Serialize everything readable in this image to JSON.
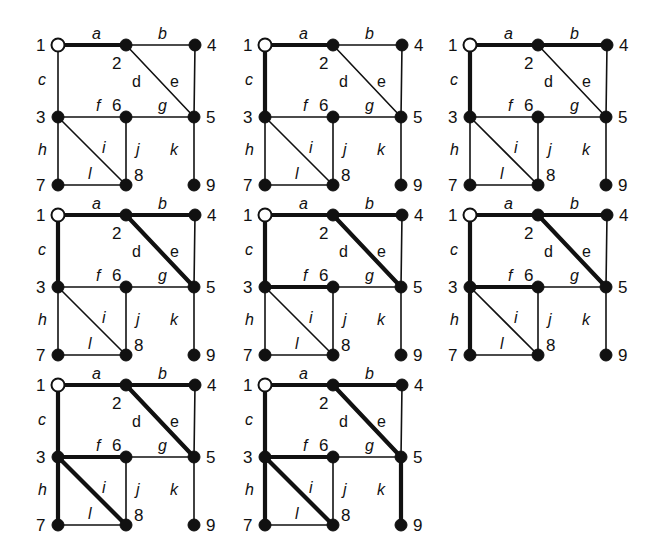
{
  "figure": {
    "colors": {
      "ink": "#111111",
      "background": "#ffffff",
      "root_fill": "#ffffff"
    },
    "nodes": [
      {
        "id": "1",
        "x": 0,
        "y": 0,
        "root": true,
        "label_dx": -22,
        "label_dy": 6
      },
      {
        "id": "2",
        "x": 68,
        "y": 0,
        "root": false,
        "label_dx": -14,
        "label_dy": 24
      },
      {
        "id": "4",
        "x": 137,
        "y": 0,
        "root": false,
        "label_dx": 12,
        "label_dy": 6
      },
      {
        "id": "3",
        "x": 0,
        "y": 72,
        "root": false,
        "label_dx": -22,
        "label_dy": 6
      },
      {
        "id": "6",
        "x": 68,
        "y": 72,
        "root": false,
        "label_dx": -14,
        "label_dy": -6
      },
      {
        "id": "5",
        "x": 136,
        "y": 72,
        "root": false,
        "label_dx": 12,
        "label_dy": 6
      },
      {
        "id": "7",
        "x": 0,
        "y": 140,
        "root": false,
        "label_dx": -22,
        "label_dy": 6
      },
      {
        "id": "8",
        "x": 68,
        "y": 140,
        "root": false,
        "label_dx": 8,
        "label_dy": -4
      },
      {
        "id": "9",
        "x": 136,
        "y": 140,
        "root": false,
        "label_dx": 12,
        "label_dy": 6
      }
    ],
    "edges": [
      {
        "id": "a",
        "from": "1",
        "to": "2",
        "lx": 34,
        "ly": -6,
        "italic": true
      },
      {
        "id": "b",
        "from": "2",
        "to": "4",
        "lx": 100,
        "ly": -6,
        "italic": true
      },
      {
        "id": "c",
        "from": "1",
        "to": "3",
        "lx": -20,
        "ly": 40,
        "italic": true
      },
      {
        "id": "d",
        "from": "2",
        "to": "5",
        "lx": 74,
        "ly": 42,
        "italic": false
      },
      {
        "id": "e",
        "from": "4",
        "to": "5",
        "lx": 112,
        "ly": 42,
        "italic": false
      },
      {
        "id": "f",
        "from": "3",
        "to": "6",
        "lx": 38,
        "ly": 66,
        "italic": true
      },
      {
        "id": "g",
        "from": "6",
        "to": "5",
        "lx": 100,
        "ly": 66,
        "italic": true
      },
      {
        "id": "h",
        "from": "3",
        "to": "7",
        "lx": -20,
        "ly": 110,
        "italic": true
      },
      {
        "id": "i",
        "from": "3",
        "to": "8",
        "lx": 44,
        "ly": 108,
        "italic": true
      },
      {
        "id": "j",
        "from": "6",
        "to": "8",
        "lx": 78,
        "ly": 110,
        "italic": true
      },
      {
        "id": "k",
        "from": "5",
        "to": "9",
        "lx": 112,
        "ly": 110,
        "italic": true
      },
      {
        "id": "l",
        "from": "7",
        "to": "8",
        "lx": 30,
        "ly": 134,
        "italic": true
      }
    ],
    "panels": [
      {
        "step": 1,
        "ox": 58,
        "oy": 45,
        "bold_edges": [
          "a"
        ]
      },
      {
        "step": 2,
        "ox": 265,
        "oy": 45,
        "bold_edges": [
          "a",
          "c"
        ]
      },
      {
        "step": 3,
        "ox": 470,
        "oy": 45,
        "bold_edges": [
          "a",
          "b",
          "c"
        ]
      },
      {
        "step": 4,
        "ox": 58,
        "oy": 215,
        "bold_edges": [
          "a",
          "b",
          "c",
          "d"
        ]
      },
      {
        "step": 5,
        "ox": 265,
        "oy": 215,
        "bold_edges": [
          "a",
          "b",
          "c",
          "d",
          "f"
        ]
      },
      {
        "step": 6,
        "ox": 470,
        "oy": 215,
        "bold_edges": [
          "a",
          "b",
          "c",
          "d",
          "f",
          "h"
        ]
      },
      {
        "step": 7,
        "ox": 58,
        "oy": 385,
        "bold_edges": [
          "a",
          "b",
          "c",
          "d",
          "f",
          "h",
          "i"
        ]
      },
      {
        "step": 8,
        "ox": 265,
        "oy": 385,
        "bold_edges": [
          "a",
          "b",
          "c",
          "d",
          "f",
          "h",
          "i",
          "k"
        ]
      }
    ]
  }
}
